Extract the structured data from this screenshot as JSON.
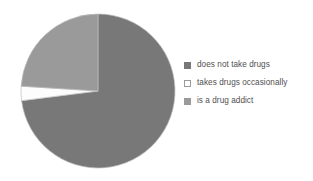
{
  "chart_data": {
    "type": "pie",
    "title": "",
    "categories": [
      "does not take drugs",
      "takes drugs occasionally",
      "is a drug addict"
    ],
    "values": [
      73,
      3,
      24
    ],
    "unit": "percent",
    "colors": [
      "#787878",
      "#ffffff",
      "#9a9a9a"
    ],
    "start_angle_deg": 0,
    "direction": "clockwise",
    "legend_position": "right",
    "grid": false,
    "data_labels_shown": false,
    "slice_outline_color": "#bdbdbd"
  },
  "legend": {
    "items": [
      {
        "label": "does not take drugs",
        "swatch_name": "legend-swatch-does-not-take-drugs",
        "color": "#787878",
        "border": "#787878"
      },
      {
        "label": "takes drugs occasionally",
        "swatch_name": "legend-swatch-takes-drugs-occasionally",
        "color": "#ffffff",
        "border": "#9a9a9a"
      },
      {
        "label": "is a drug addict",
        "swatch_name": "legend-swatch-is-a-drug-addict",
        "color": "#9a9a9a",
        "border": "#9a9a9a"
      }
    ]
  },
  "pie": {
    "center_x": 98,
    "center_y": 91,
    "radius": 77,
    "slices": [
      {
        "name": "does-not-take-drugs",
        "start_deg": 0,
        "end_deg": 262.8,
        "fill": "#787878"
      },
      {
        "name": "takes-drugs-occasionally",
        "start_deg": 262.8,
        "end_deg": 273.6,
        "fill": "#fdfdfd"
      },
      {
        "name": "is-a-drug-addict",
        "start_deg": 273.6,
        "end_deg": 360,
        "fill": "#9a9a9a"
      }
    ]
  }
}
